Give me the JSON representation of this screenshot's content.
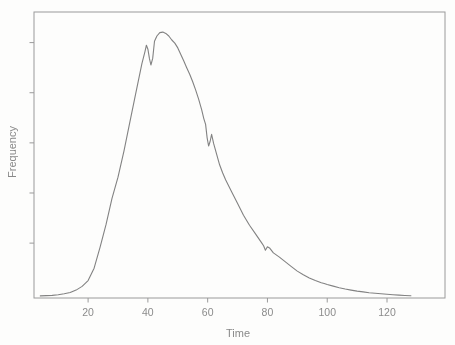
{
  "window": {
    "width": 455,
    "height": 345,
    "background": "#fcfcfb"
  },
  "chart_data": {
    "type": "line",
    "title": "",
    "xlabel": "Time",
    "ylabel": "Frequency",
    "x_ticks": [
      20,
      40,
      60,
      80,
      100,
      120
    ],
    "x_tick_labels": [
      "20",
      "40",
      "60",
      "80",
      "100",
      "120"
    ],
    "y_ticks": [
      0.2,
      0.39,
      0.58,
      0.77,
      0.96
    ],
    "y_tick_labels": [],
    "xlim": [
      1.9,
      139.4
    ],
    "ylim": [
      -0.008,
      1.076
    ],
    "grid": false,
    "legend": false,
    "box": true,
    "line_color": "#828282",
    "axis_color": "#9a9a9a",
    "text_color": "#8b8b8b",
    "series": [
      {
        "name": "frequency-density-curve",
        "x": [
          4,
          6,
          8,
          10,
          12,
          14,
          16,
          18,
          20,
          22,
          24,
          26,
          28,
          30,
          32,
          34,
          36,
          37,
          38,
          39,
          39.5,
          40,
          40.5,
          41,
          41.6,
          42.2,
          43,
          44,
          45,
          46,
          47,
          48,
          49,
          50,
          51,
          52,
          53,
          54,
          55,
          56,
          57,
          58,
          58.7,
          59.3,
          59.8,
          60.3,
          60.8,
          61.3,
          62,
          63,
          64,
          65,
          66,
          68,
          70,
          72,
          74,
          76,
          78,
          78.7,
          79.3,
          80,
          80.7,
          82,
          84,
          86,
          88,
          90,
          92,
          94,
          96,
          98,
          99,
          100,
          102,
          104,
          106,
          108,
          110,
          112,
          114,
          116,
          118,
          120,
          122,
          124,
          126,
          128
        ],
        "y": [
          0,
          0.001,
          0.002,
          0.004,
          0.008,
          0.013,
          0.022,
          0.036,
          0.058,
          0.105,
          0.185,
          0.27,
          0.37,
          0.45,
          0.55,
          0.66,
          0.77,
          0.825,
          0.88,
          0.925,
          0.95,
          0.935,
          0.9,
          0.875,
          0.9,
          0.965,
          0.985,
          0.998,
          1.0,
          0.995,
          0.985,
          0.97,
          0.958,
          0.94,
          0.915,
          0.89,
          0.865,
          0.84,
          0.812,
          0.78,
          0.745,
          0.705,
          0.672,
          0.65,
          0.6,
          0.568,
          0.585,
          0.612,
          0.578,
          0.537,
          0.497,
          0.467,
          0.44,
          0.395,
          0.35,
          0.306,
          0.268,
          0.235,
          0.202,
          0.19,
          0.173,
          0.186,
          0.182,
          0.163,
          0.147,
          0.129,
          0.111,
          0.094,
          0.08,
          0.068,
          0.058,
          0.05,
          0.047,
          0.043,
          0.037,
          0.031,
          0.026,
          0.022,
          0.018,
          0.015,
          0.012,
          0.01,
          0.008,
          0.006,
          0.0045,
          0.003,
          0.0015,
          0.0005
        ]
      }
    ]
  }
}
